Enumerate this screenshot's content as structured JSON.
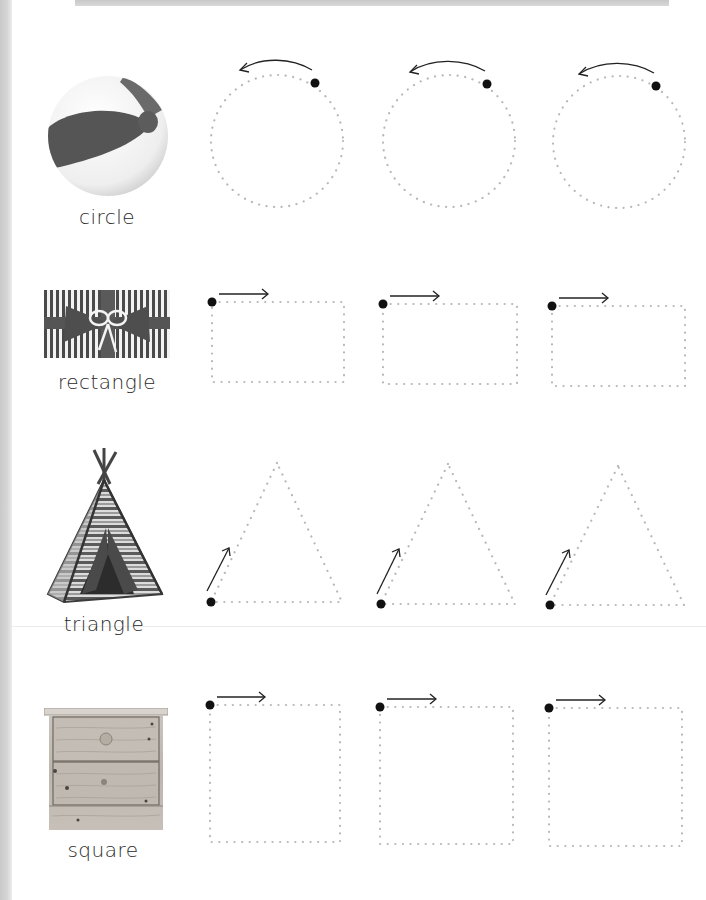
{
  "worksheet": {
    "rows": [
      {
        "shape": "circle",
        "label": "circle",
        "picture": "beach-ball-icon",
        "start_direction": "counter-clockwise arrow at top",
        "trace_count": 3
      },
      {
        "shape": "rectangle",
        "label": "rectangle",
        "picture": "gift-box-icon",
        "start_direction": "right arrow at top-left",
        "trace_count": 3
      },
      {
        "shape": "triangle",
        "label": "triangle",
        "picture": "teepee-tent-icon",
        "start_direction": "up-right arrow at bottom-left",
        "trace_count": 3
      },
      {
        "shape": "square",
        "label": "square",
        "picture": "wooden-dresser-icon",
        "start_direction": "right arrow at top-left",
        "trace_count": 3
      }
    ]
  },
  "colors": {
    "dots": "#b8b8b8",
    "start_dot": "#111111",
    "arrow": "#222222",
    "label_text": "#2a2a2a",
    "page_edge": "#cccccc"
  }
}
